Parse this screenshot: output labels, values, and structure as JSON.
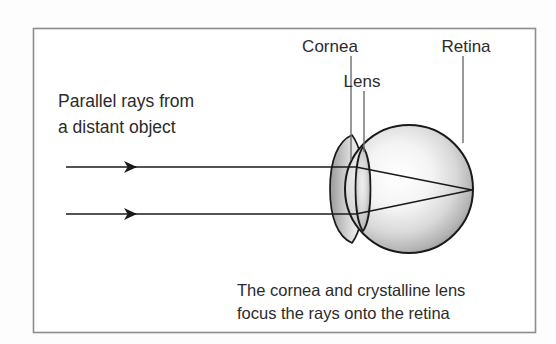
{
  "figure": {
    "type": "optical-diagram",
    "frame": {
      "border_color": "#8d8d8d",
      "background": "#ffffff"
    },
    "page_background": "#fdfdfd",
    "ink_color": "#1a1a1a",
    "text_color": "#2b2b2b"
  },
  "annotations": {
    "cornea": {
      "label": "Cornea",
      "x": 330,
      "y": 46
    },
    "lens": {
      "label": "Lens",
      "x": 354,
      "y": 81
    },
    "retina": {
      "label": "Retina",
      "x": 449,
      "y": 46
    }
  },
  "source_text": {
    "line1": "Parallel rays from",
    "line2": "a distant object"
  },
  "caption": {
    "line1": "The cornea and crystalline lens",
    "line2": "focus the rays onto the retina"
  },
  "rays": {
    "upper_y": 167,
    "lower_y": 214,
    "start_x": 66,
    "arrowhead_x": 136,
    "focus_x": 472,
    "focus_y": 190
  },
  "eye": {
    "globe_center_x": 409,
    "globe_center_y": 189,
    "globe_radius": 64,
    "cornea_apex_x": 330,
    "lens_center_x": 363,
    "lens_half_height": 42,
    "lens_half_width": 10
  }
}
